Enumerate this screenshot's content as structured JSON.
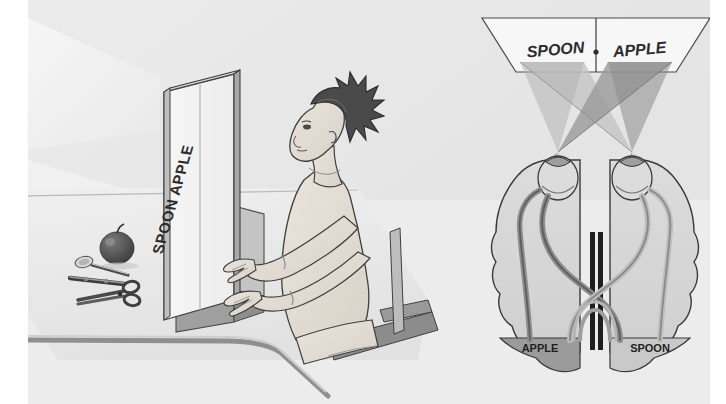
{
  "figure": {
    "background_color": "#ececec",
    "page_color": "#ffffff"
  },
  "left_scene": {
    "name": "experiment-setup-scene",
    "screen": {
      "label": "SPOON  APPLE",
      "word_left": "SPOON",
      "word_right": "APPLE",
      "divider": "|"
    },
    "table_objects": [
      {
        "name": "apple",
        "label": "apple"
      },
      {
        "name": "spoon",
        "label": "spoon"
      },
      {
        "name": "pen",
        "label": "pen"
      },
      {
        "name": "scissors",
        "label": "scissors"
      }
    ],
    "subject": {
      "name": "seated-participant",
      "label": "participant"
    }
  },
  "right_scene": {
    "name": "split-brain-diagram",
    "display": {
      "left_word": "SPOON",
      "right_word": "APPLE",
      "fixation_mark": "+"
    },
    "brain": {
      "left_hemisphere_label": "APPLE",
      "right_hemisphere_label": "SPOON"
    },
    "colors": {
      "brain_fill": "#d6d6d6",
      "occipital_dark": "#9b9b9b",
      "occipital_light": "#c9c9c9",
      "nerve_dark": "#8d8d8d",
      "nerve_light": "#bdbdbd",
      "cone_light": "#c2c2c2",
      "cone_dark": "#8f8f8f",
      "outline": "#3a3a3a",
      "screen_fill": "#f7f7f7"
    }
  },
  "palette": {
    "ink": "#2f2f2f",
    "paper": "#ececec",
    "table_top": "#e6e6e6",
    "table_edge": "#8a8a8a",
    "panel_face": "#f4f4f4",
    "panel_side": "#bdbdbd",
    "skin": "#e3ddd6",
    "hair": "#4a4a4a"
  }
}
